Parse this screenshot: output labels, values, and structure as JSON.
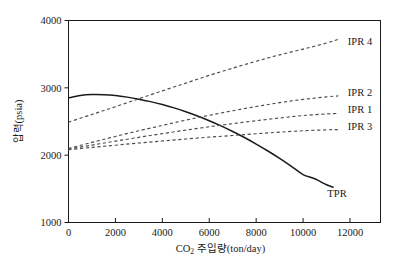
{
  "chart_data": {
    "type": "line",
    "title": "",
    "xlabel": "CO₂ 주입량(ton/day)",
    "ylabel": "압력(psia)",
    "xlim": [
      0,
      13300
    ],
    "ylim": [
      1000,
      4000
    ],
    "xticks": [
      0,
      2000,
      4000,
      6000,
      8000,
      10000,
      12000
    ],
    "yticks": [
      1000,
      2000,
      3000,
      4000
    ],
    "xtick_labels": [
      "0",
      "2000",
      "4000",
      "6000",
      "8000",
      "10000",
      "12000"
    ],
    "ytick_labels": [
      "1000",
      "2000",
      "3000",
      "4000"
    ],
    "grid": false,
    "legend_position": "inline-right-of-curve-ends",
    "series": [
      {
        "name": "TPR",
        "style": "solid",
        "color": "#1a1a1a",
        "label_x": 11450,
        "label_y": 1440,
        "x": [
          0,
          500,
          1000,
          1500,
          2000,
          2500,
          3000,
          3500,
          4000,
          4500,
          5000,
          5500,
          6000,
          6500,
          7000,
          7500,
          8000,
          8500,
          9000,
          9500,
          10000,
          10500,
          11000,
          11300
        ],
        "y": [
          2850,
          2885,
          2900,
          2898,
          2885,
          2862,
          2832,
          2795,
          2752,
          2702,
          2645,
          2582,
          2512,
          2435,
          2352,
          2262,
          2165,
          2062,
          1952,
          1835,
          1712,
          1650,
          1560,
          1520
        ]
      },
      {
        "name": "IPR 4",
        "style": "dashed",
        "color": "#4d4d4d",
        "label_x": 11900,
        "label_y": 3700,
        "x": [
          0,
          1000,
          2000,
          3000,
          4000,
          5000,
          6000,
          7000,
          8000,
          9000,
          10000,
          11000,
          11500
        ],
        "y": [
          2490,
          2605,
          2720,
          2838,
          2955,
          3070,
          3185,
          3292,
          3395,
          3490,
          3575,
          3665,
          3720
        ]
      },
      {
        "name": "IPR 2",
        "style": "dashed",
        "color": "#4d4d4d",
        "label_x": 11900,
        "label_y": 2940,
        "x": [
          0,
          1000,
          2000,
          3000,
          4000,
          5000,
          6000,
          7000,
          8000,
          9000,
          10000,
          11000,
          11500
        ],
        "y": [
          2100,
          2190,
          2278,
          2362,
          2442,
          2520,
          2592,
          2660,
          2722,
          2780,
          2828,
          2866,
          2880
        ]
      },
      {
        "name": "IPR 1",
        "style": "dashed",
        "color": "#4d4d4d",
        "label_x": 11900,
        "label_y": 2680,
        "x": [
          0,
          1000,
          2000,
          3000,
          4000,
          5000,
          6000,
          7000,
          8000,
          9000,
          10000,
          11000,
          11500
        ],
        "y": [
          2090,
          2150,
          2208,
          2265,
          2320,
          2372,
          2422,
          2468,
          2512,
          2552,
          2588,
          2612,
          2620
        ]
      },
      {
        "name": "IPR 3",
        "style": "dashed",
        "color": "#4d4d4d",
        "label_x": 11900,
        "label_y": 2430,
        "x": [
          0,
          1000,
          2000,
          3000,
          4000,
          5000,
          6000,
          7000,
          8000,
          9000,
          10000,
          11000,
          11500
        ],
        "y": [
          2080,
          2115,
          2148,
          2180,
          2210,
          2240,
          2268,
          2292,
          2318,
          2342,
          2362,
          2376,
          2380
        ]
      }
    ]
  },
  "axis": {
    "xlabel_main": "CO",
    "xlabel_sub": "2",
    "xlabel_rest": " 주입량(ton/day)",
    "ylabel": "압력(psia)"
  },
  "colors": {
    "axis": "#1a1a1a",
    "solid_curve": "#1a1a1a",
    "dashed_curve": "#4d4d4d",
    "background": "#ffffff"
  }
}
